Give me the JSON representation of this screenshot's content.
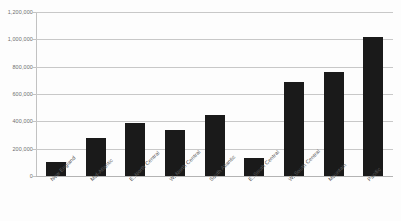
{
  "chart_data": {
    "type": "bar",
    "title": "",
    "subtitle": "",
    "xlabel": "",
    "ylabel": "",
    "categories": [
      "New England",
      "Mid-Atlantic",
      "E. North Central",
      "W. North Central",
      "South Atlantic",
      "E. South Central",
      "W. South Central",
      "Mountain",
      "Pacific"
    ],
    "values": [
      100000,
      275000,
      385000,
      335000,
      445000,
      130000,
      690000,
      760000,
      1015000
    ],
    "series": [
      {
        "name": "",
        "values": [
          100000,
          275000,
          385000,
          335000,
          445000,
          130000,
          690000,
          760000,
          1015000
        ]
      }
    ],
    "ylim": [
      0,
      1200000
    ],
    "ytick_values": [
      0,
      200000,
      400000,
      600000,
      800000,
      1000000,
      1200000
    ],
    "ytick_labels": [
      "0",
      "200,000",
      "400,000",
      "600,000",
      "800,000",
      "1,000,000",
      "1,200,000"
    ],
    "grid": true,
    "grid_axis": "y",
    "legend": false,
    "legend_position": "none",
    "annotations": [],
    "bar_color": "#1a1a1a",
    "gridline_color": "#c8c8c8",
    "axis_color": "#c2c2c2",
    "label_color": "#6e6e6e",
    "background_color": "#fdfdfd",
    "xtick_label_rotation": -45
  }
}
